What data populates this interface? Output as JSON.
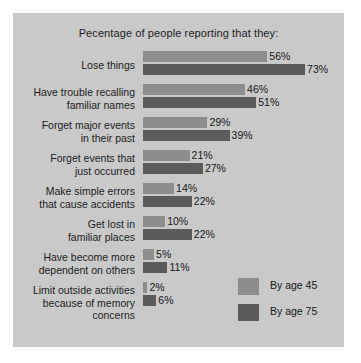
{
  "chart_data": {
    "type": "bar",
    "orientation": "horizontal",
    "title": "Pecentage of people reporting that they:",
    "xlabel": "",
    "ylabel": "",
    "xlim": [
      0,
      73
    ],
    "grid": false,
    "legend_position": "bottom-right",
    "value_suffix": "%",
    "categories": [
      "Lose things",
      "Have trouble recalling familiar names",
      "Forget major events in their past",
      "Forget events that just occurred",
      "Make simple errors that cause accidents",
      "Get lost in familiar places",
      "Have become more dependent on others",
      "Limit outside activities because of memory concerns"
    ],
    "category_lines": [
      [
        "Lose things"
      ],
      [
        "Have trouble recalling",
        "familiar names"
      ],
      [
        "Forget major events",
        "in their past"
      ],
      [
        "Forget events that",
        "just occurred"
      ],
      [
        "Make simple errors",
        "that cause accidents"
      ],
      [
        "Get lost in",
        "familiar places"
      ],
      [
        "Have become more",
        "dependent on others"
      ],
      [
        "Limit outside activities",
        "because of memory",
        "concerns"
      ]
    ],
    "series": [
      {
        "name": "By age 45",
        "color": "#8d8d8d",
        "values": [
          56,
          46,
          29,
          21,
          14,
          10,
          5,
          2
        ],
        "labels": [
          "56%",
          "46%",
          "29%",
          "21%",
          "14%",
          "10%",
          "5%",
          "2%"
        ]
      },
      {
        "name": "By age 75",
        "color": "#5b5b5b",
        "values": [
          73,
          51,
          39,
          27,
          22,
          22,
          11,
          6
        ],
        "labels": [
          "73%",
          "51%",
          "39%",
          "27%",
          "22%",
          "22%",
          "11%",
          "6%"
        ]
      }
    ]
  },
  "panel": {
    "background_color": "#c9c9c9"
  }
}
